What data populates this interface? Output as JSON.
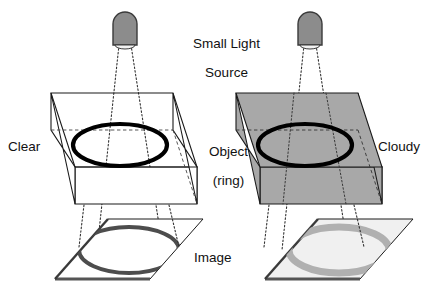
{
  "figure": {
    "title_label": "Small Light\nSource",
    "left_medium_label": "Clear",
    "right_medium_label": "Cloudy",
    "object_label": "Object\n(ring)",
    "image_label": "Image"
  },
  "labels": {
    "small_light_source_line1": "Small Light",
    "small_light_source_line2": "Source",
    "clear": "Clear",
    "cloudy": "Cloudy",
    "object_line1": "Object",
    "object_line2": "(ring)",
    "image": "Image"
  },
  "colors": {
    "background": "#ffffff",
    "outline": "#1a1a1a",
    "lamp_fill": "#8c8c8c",
    "lamp_outline": "#3a3a3a",
    "lamp_aperture": "#f2f2f2",
    "clear_box_fill": "#ffffff",
    "cloudy_box_fill": "#a8a8a8",
    "cloudy_box_top_fill": "#a8a8a8",
    "object_ring": "#000000",
    "sharp_image_ring": "#4d4d4d",
    "blurred_image_ring": "#b0b0b0",
    "left_plane_fill": "#ffffff",
    "right_plane_fill": "#f0f0f0",
    "plane_edge_shadow": "#555555",
    "ray_line": "#333333",
    "hidden_edge": "#444444"
  },
  "scene": {
    "panels": [
      {
        "name": "clear-panel",
        "medium": "Clear",
        "medium_fill": "#ffffff",
        "image_quality": "sharp",
        "image_ring_color": "#4d4d4d",
        "image_ring_thickness_px": 4
      },
      {
        "name": "cloudy-panel",
        "medium": "Cloudy",
        "medium_fill": "#a8a8a8",
        "image_quality": "blurred",
        "image_ring_color": "#b0b0b0",
        "image_ring_thickness_px": 7
      }
    ],
    "elements": [
      "small-light-source",
      "light-rays",
      "medium-box",
      "object-ring",
      "image-plane",
      "projected-image-ring"
    ]
  }
}
